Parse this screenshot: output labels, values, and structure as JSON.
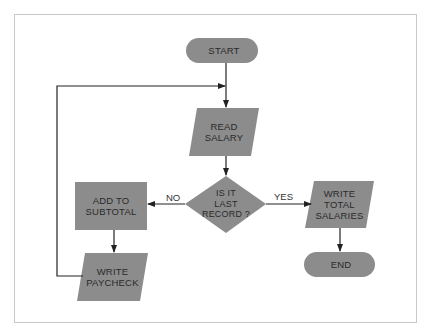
{
  "colors": {
    "shape_fill": "#8c8c8c",
    "line": "#222222",
    "text": "#2a2a2a",
    "frame_border": "#c8c8c8",
    "background": "#ffffff"
  },
  "nodes": {
    "start": {
      "type": "terminal",
      "label": "START"
    },
    "read_salary": {
      "type": "input-output",
      "label": "READ\nSALARY"
    },
    "decision": {
      "type": "decision",
      "label": "IS IT\nLAST\nRECORD ?"
    },
    "add_subtotal": {
      "type": "process",
      "label": "ADD TO\nSUBTOTAL"
    },
    "write_paycheck": {
      "type": "input-output",
      "label": "WRITE\nPAYCHECK"
    },
    "write_total": {
      "type": "input-output",
      "label": "WRITE\nTOTAL\nSALARIES"
    },
    "end": {
      "type": "terminal",
      "label": "END"
    }
  },
  "edges": {
    "no_label": "NO",
    "yes_label": "YES",
    "list": [
      {
        "from": "start",
        "to": "read_salary"
      },
      {
        "from": "read_salary",
        "to": "decision"
      },
      {
        "from": "decision",
        "to": "add_subtotal",
        "label": "NO"
      },
      {
        "from": "decision",
        "to": "write_total",
        "label": "YES"
      },
      {
        "from": "add_subtotal",
        "to": "write_paycheck"
      },
      {
        "from": "write_paycheck",
        "to": "read_salary",
        "label": "loop back"
      },
      {
        "from": "write_total",
        "to": "end"
      }
    ]
  }
}
